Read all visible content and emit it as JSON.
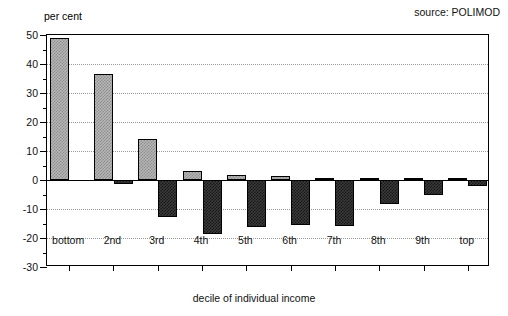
{
  "chart_data": {
    "type": "bar",
    "title": "",
    "subtitle": "",
    "xlabel": "decile of individual income",
    "ylabel": "per cent",
    "unit_label": "per cent",
    "categories": [
      "bottom",
      "2nd",
      "3rd",
      "4th",
      "5th",
      "6th",
      "7th",
      "8th",
      "9th",
      "top"
    ],
    "series": [
      {
        "name": "gains",
        "style": "light-hatched",
        "color": "#b6b6b6",
        "values": [
          49.0,
          36.5,
          14.0,
          3.2,
          1.6,
          1.5,
          0.4,
          0.3,
          0.2,
          0.2
        ]
      },
      {
        "name": "losses",
        "style": "dark-hatched",
        "color": "#3a3a3a",
        "values": [
          0.0,
          -1.5,
          -12.8,
          -18.5,
          -16.2,
          -15.5,
          -15.9,
          -8.4,
          -5.2,
          -2.1
        ]
      }
    ],
    "ylim": [
      -30,
      50
    ],
    "yticks": [
      50,
      40,
      30,
      20,
      10,
      0,
      -10,
      -20,
      -30
    ],
    "ytick_labels": [
      "50",
      "40",
      "30",
      "20",
      "10",
      "0",
      "-10",
      "-20",
      "-30"
    ],
    "yminor_step": 5,
    "grid": "horizontal-dotted",
    "legend": "none",
    "annotations": [
      {
        "name": "source",
        "text": "source: POLIMOD",
        "position": "top-right"
      }
    ]
  },
  "annotations": {
    "source_text": "source: POLIMOD"
  }
}
